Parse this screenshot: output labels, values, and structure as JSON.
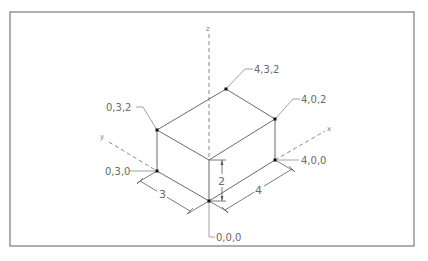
{
  "diagram": {
    "title": "",
    "type": "isometric-box-coordinates",
    "axes": {
      "z": {
        "label": "z"
      },
      "y": {
        "label": "y"
      },
      "x": {
        "label": "x"
      }
    },
    "points": [
      {
        "id": "p432",
        "label": "4,3,2",
        "coords": [
          4,
          3,
          2
        ]
      },
      {
        "id": "p032",
        "label": "0,3,2",
        "coords": [
          0,
          3,
          2
        ]
      },
      {
        "id": "p402",
        "label": "4,0,2",
        "coords": [
          4,
          0,
          2
        ]
      },
      {
        "id": "p030",
        "label": "0,3,0",
        "coords": [
          0,
          3,
          0
        ]
      },
      {
        "id": "p400",
        "label": "4,0,0",
        "coords": [
          4,
          0,
          0
        ]
      },
      {
        "id": "p000",
        "label": "0,0,0",
        "coords": [
          0,
          0,
          0
        ]
      }
    ],
    "dimensions": [
      {
        "id": "dim-y",
        "label": "3",
        "axis": "y"
      },
      {
        "id": "dim-z",
        "label": "2",
        "axis": "z"
      },
      {
        "id": "dim-x",
        "label": "4",
        "axis": "x"
      }
    ],
    "colors": {
      "frame": "#7a7a7a",
      "edge": "#5a5a5a",
      "point": "#111111",
      "label": "#6a6a6a"
    }
  }
}
